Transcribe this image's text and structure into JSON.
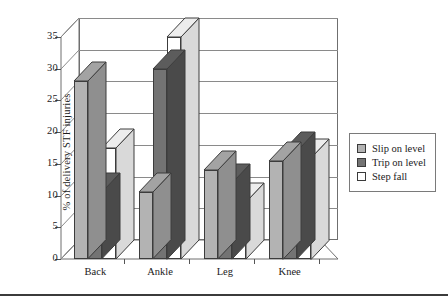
{
  "chart_data": {
    "type": "bar",
    "title": "",
    "subtitle": "",
    "xlabel": "",
    "ylabel": "% of delivery STF injuries",
    "categories": [
      "Back",
      "Ankle",
      "Leg",
      "Knee"
    ],
    "series": [
      {
        "name": "Slip on level",
        "values": [
          28,
          10.5,
          14,
          15.5
        ],
        "color": "#b3b3b3"
      },
      {
        "name": "Trip on level",
        "values": [
          10.5,
          30,
          12,
          17
        ],
        "color": "#737373"
      },
      {
        "name": "Step fall",
        "values": [
          17.5,
          35,
          9,
          16
        ],
        "color": "#ffffff"
      }
    ],
    "ylim": [
      0,
      35
    ],
    "yticks": [
      0,
      5,
      10,
      15,
      20,
      25,
      30,
      35
    ],
    "ytick_labels": [
      "0",
      "5",
      "10",
      "15",
      "20",
      "25",
      "30",
      "35"
    ],
    "grid": true,
    "grid_axis": "y",
    "legend_position": "right",
    "style": "3d-grouped-bars",
    "background": "#ffffff"
  },
  "legend": {
    "items": [
      {
        "label": "Slip on level",
        "swatch": "#b3b3b3"
      },
      {
        "label": "Trip on level",
        "swatch": "#737373"
      },
      {
        "label": "Step fall",
        "swatch": "#ffffff"
      }
    ]
  }
}
